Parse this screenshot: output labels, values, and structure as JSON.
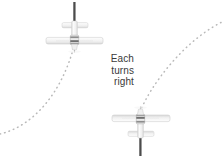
{
  "figure": {
    "type": "diagram",
    "background_color": "#ffffff",
    "caption": {
      "lines": [
        "Each",
        "turns",
        "right"
      ],
      "align": "right",
      "color": "#3a3a3a",
      "x": 134,
      "y": 53
    },
    "aircraft": [
      {
        "name": "upper-aircraft",
        "heading": "south",
        "center_x": 74.5,
        "center_y": 32,
        "wingspan_px": 57,
        "wing_left_x": 46,
        "wing_right_x": 103,
        "wing_y": 41,
        "stabilizer_left_x": 62,
        "stabilizer_right_x": 88,
        "stabilizer_y": 27,
        "tail_line_top_y": 2,
        "tail_line_bottom_y": 22,
        "body_color": "#f2f2f2",
        "outline_color": "#c9c9c9",
        "accent_color": "#555555"
      },
      {
        "name": "lower-aircraft",
        "heading": "north",
        "center_x": 140.5,
        "center_y": 126,
        "wingspan_px": 58,
        "wing_left_x": 112,
        "wing_right_x": 170,
        "wing_y": 118,
        "stabilizer_left_x": 128,
        "stabilizer_right_x": 154,
        "stabilizer_y": 132,
        "tail_line_top_y": 137,
        "tail_line_bottom_y": 156,
        "body_color": "#f2f2f2",
        "outline_color": "#c9c9c9",
        "accent_color": "#555555"
      }
    ],
    "paths": [
      {
        "name": "left-flight-path",
        "style": "dotted",
        "dot_color": "#b8b8b8",
        "dot_size": 1.4,
        "start": [
          0,
          134
        ],
        "end": [
          74,
          46
        ],
        "control_1": [
          34,
          126
        ],
        "control_2": [
          62,
          92
        ],
        "description": "curve from lower-left edge up to upper aircraft"
      },
      {
        "name": "right-flight-path",
        "style": "dotted",
        "dot_color": "#b8b8b8",
        "dot_size": 1.4,
        "start": [
          140,
          112
        ],
        "end": [
          224,
          22
        ],
        "control_1": [
          150,
          86
        ],
        "control_2": [
          184,
          40
        ],
        "description": "curve from lower aircraft up to upper-right edge"
      }
    ]
  }
}
